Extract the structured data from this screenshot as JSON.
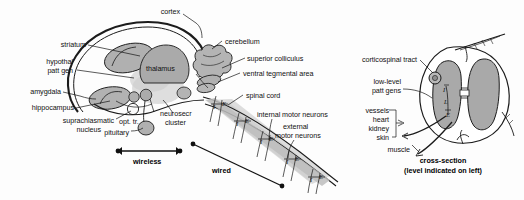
{
  "figure": {
    "background_color": "#fdfdfd",
    "ink_color": "#141414",
    "gray_fill": "#a9a9a9",
    "light_gray_fill": "#c4c4c4",
    "shadow_gray": "#bdbdbd"
  },
  "brain_labels": {
    "cortex": "cortex",
    "striatum": "striatum",
    "hypothal_patt_gen_line1": "hypothal",
    "hypothal_patt_gen_line2": "patt gen",
    "amygdala": "amygdala",
    "hippocampus": "hippocampus",
    "suprachiasmatic_line1": "suprachiasmatic",
    "suprachiasmatic_line2": "nucleus",
    "pituitary": "pituitary",
    "opt_tr": "opt. tr.",
    "thalamus": "thalamus",
    "neurosecr_line1": "neurosecr",
    "neurosecr_line2": "cluster",
    "cerebellum": "cerebellum",
    "superior_colliculus": "superior colliculus",
    "ventral_tegmental_area": "ventral tegmental area",
    "spinal_cord": "spinal cord",
    "internal_motor_neurons": "internal motor neurons",
    "external_motor_neurons_line1": "external",
    "external_motor_neurons_line2": "motor neurons"
  },
  "pathway_labels": {
    "wireless": "wireless",
    "wired": "wired"
  },
  "cross_section_labels": {
    "corticospinal_tract": "corticospinal tract",
    "low_level_patt_gens_line1": "low-level",
    "low_level_patt_gens_line2": "patt gens",
    "targets": [
      "vessels",
      "heart",
      "kidney",
      "skin"
    ],
    "muscle": "muscle",
    "caption_line1": "cross-section",
    "caption_line2": "(level indicated on left)"
  },
  "nerve_markers": {
    "internal": "I",
    "external": "E"
  }
}
